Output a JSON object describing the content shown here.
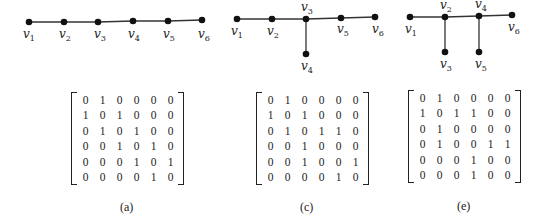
{
  "panels": [
    {
      "id": "a",
      "caption": "(a)",
      "vertices": [
        {
          "name": "v",
          "sub": "1",
          "x": 29,
          "y": 22,
          "lx": 23,
          "ly": 38
        },
        {
          "name": "v",
          "sub": "2",
          "x": 64,
          "y": 22,
          "lx": 59,
          "ly": 38
        },
        {
          "name": "v",
          "sub": "3",
          "x": 98,
          "y": 22,
          "lx": 94,
          "ly": 38
        },
        {
          "name": "v",
          "sub": "4",
          "x": 133,
          "y": 21,
          "lx": 128,
          "ly": 38
        },
        {
          "name": "v",
          "sub": "5",
          "x": 168,
          "y": 21,
          "lx": 163,
          "ly": 38
        },
        {
          "name": "v",
          "sub": "6",
          "x": 202,
          "y": 20,
          "lx": 198,
          "ly": 38
        }
      ],
      "edges": [
        [
          0,
          1
        ],
        [
          1,
          2
        ],
        [
          2,
          3
        ],
        [
          3,
          4
        ],
        [
          4,
          5
        ]
      ],
      "matrix": [
        [
          0,
          1,
          0,
          0,
          0,
          0
        ],
        [
          1,
          0,
          1,
          0,
          0,
          0
        ],
        [
          0,
          1,
          0,
          1,
          0,
          0
        ],
        [
          0,
          0,
          1,
          0,
          1,
          0
        ],
        [
          0,
          0,
          0,
          1,
          0,
          1
        ],
        [
          0,
          0,
          0,
          0,
          1,
          0
        ]
      ],
      "matrix_pos": {
        "x": 77,
        "y": 92
      },
      "caption_pos": {
        "x": 120,
        "y": 200
      }
    },
    {
      "id": "c",
      "caption": "(c)",
      "vertices": [
        {
          "name": "v",
          "sub": "1",
          "x": 237,
          "y": 19,
          "lx": 231,
          "ly": 35
        },
        {
          "name": "v",
          "sub": "2",
          "x": 272,
          "y": 19,
          "lx": 267,
          "ly": 35
        },
        {
          "name": "v",
          "sub": "3",
          "x": 306,
          "y": 19,
          "lx": 301,
          "ly": 11
        },
        {
          "name": "v",
          "sub": "4",
          "x": 306,
          "y": 54,
          "lx": 301,
          "ly": 70
        },
        {
          "name": "v",
          "sub": "5",
          "x": 341,
          "y": 18,
          "lx": 337,
          "ly": 33
        },
        {
          "name": "v",
          "sub": "6",
          "x": 375,
          "y": 17,
          "lx": 372,
          "ly": 33
        }
      ],
      "edges": [
        [
          0,
          1
        ],
        [
          1,
          2
        ],
        [
          2,
          3
        ],
        [
          2,
          4
        ],
        [
          4,
          5
        ]
      ],
      "matrix": [
        [
          0,
          1,
          0,
          0,
          0,
          0
        ],
        [
          1,
          0,
          1,
          0,
          0,
          0
        ],
        [
          0,
          1,
          0,
          1,
          1,
          0
        ],
        [
          0,
          0,
          1,
          0,
          0,
          0
        ],
        [
          0,
          0,
          1,
          0,
          0,
          1
        ],
        [
          0,
          0,
          0,
          0,
          1,
          0
        ]
      ],
      "matrix_pos": {
        "x": 262,
        "y": 92
      },
      "caption_pos": {
        "x": 300,
        "y": 200
      }
    },
    {
      "id": "e",
      "caption": "(e)",
      "vertices": [
        {
          "name": "v",
          "sub": "1",
          "x": 410,
          "y": 17,
          "lx": 405,
          "ly": 33
        },
        {
          "name": "v",
          "sub": "2",
          "x": 445,
          "y": 17,
          "lx": 440,
          "ly": 9
        },
        {
          "name": "v",
          "sub": "3",
          "x": 445,
          "y": 52,
          "lx": 440,
          "ly": 68
        },
        {
          "name": "v",
          "sub": "4",
          "x": 479,
          "y": 16,
          "lx": 475,
          "ly": 8
        },
        {
          "name": "v",
          "sub": "5",
          "x": 479,
          "y": 52,
          "lx": 475,
          "ly": 68
        },
        {
          "name": "v",
          "sub": "6",
          "x": 512,
          "y": 15,
          "lx": 508,
          "ly": 31
        }
      ],
      "edges": [
        [
          0,
          1
        ],
        [
          1,
          2
        ],
        [
          1,
          3
        ],
        [
          3,
          4
        ],
        [
          3,
          5
        ]
      ],
      "matrix": [
        [
          0,
          1,
          0,
          0,
          0,
          0
        ],
        [
          1,
          0,
          1,
          1,
          0,
          0
        ],
        [
          0,
          1,
          0,
          0,
          0,
          0
        ],
        [
          0,
          1,
          0,
          0,
          1,
          1
        ],
        [
          0,
          0,
          0,
          1,
          0,
          0
        ],
        [
          0,
          0,
          0,
          1,
          0,
          0
        ]
      ],
      "matrix_pos": {
        "x": 414,
        "y": 90
      },
      "caption_pos": {
        "x": 457,
        "y": 199
      }
    }
  ]
}
